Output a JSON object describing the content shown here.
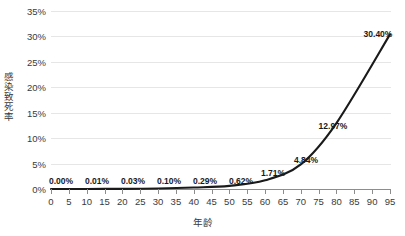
{
  "chart_data": {
    "type": "line",
    "title": "",
    "xlabel": "年龄",
    "ylabel": "感染致死率",
    "x": [
      0,
      10,
      20,
      30,
      40,
      50,
      60,
      70,
      80,
      95
    ],
    "values": [
      0.0,
      0.01,
      0.03,
      0.1,
      0.29,
      0.62,
      1.71,
      4.84,
      12.97,
      30.4
    ],
    "point_labels": [
      "0.00%",
      "0.01%",
      "0.03%",
      "0.10%",
      "0.29%",
      "0.62%",
      "1.71%",
      "4.84%",
      "12.97%",
      "30.40%"
    ],
    "xlim": [
      0,
      95
    ],
    "ylim": [
      0,
      35
    ],
    "x_ticks": [
      0,
      5,
      10,
      15,
      20,
      25,
      30,
      35,
      40,
      45,
      50,
      55,
      60,
      65,
      70,
      75,
      80,
      85,
      90,
      95
    ],
    "x_tick_labels": [
      "0",
      "5",
      "10",
      "15",
      "20",
      "25",
      "30",
      "35",
      "40",
      "45",
      "50",
      "55",
      "60",
      "65",
      "70",
      "75",
      "80",
      "85",
      "90",
      "95"
    ],
    "y_ticks": [
      0,
      5,
      10,
      15,
      20,
      25,
      30,
      35
    ],
    "y_tick_labels": [
      "0%",
      "5%",
      "10%",
      "15%",
      "20%",
      "25%",
      "30%",
      "35%"
    ],
    "grid": true,
    "legend": false,
    "series_color": "#1a1a1a",
    "grid_color": "#e6e6e6",
    "axis_color": "#8d8d8d",
    "background_color": "#ffffff",
    "label_color": "#3a3a3a"
  }
}
